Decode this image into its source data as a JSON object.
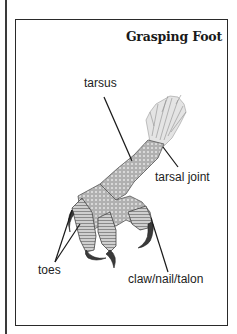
{
  "figure": {
    "title": "Grasping Foot",
    "labels": {
      "tarsus": "tarsus",
      "tarsal_joint": "tarsal joint",
      "toes": "toes",
      "claw": "claw/nail/talon"
    },
    "colors": {
      "ink": "#222222",
      "border": "#2a2a2a",
      "background": "#ffffff",
      "scale_shade": "#8a8a8a",
      "feather_shade": "#b5b5b5"
    }
  }
}
